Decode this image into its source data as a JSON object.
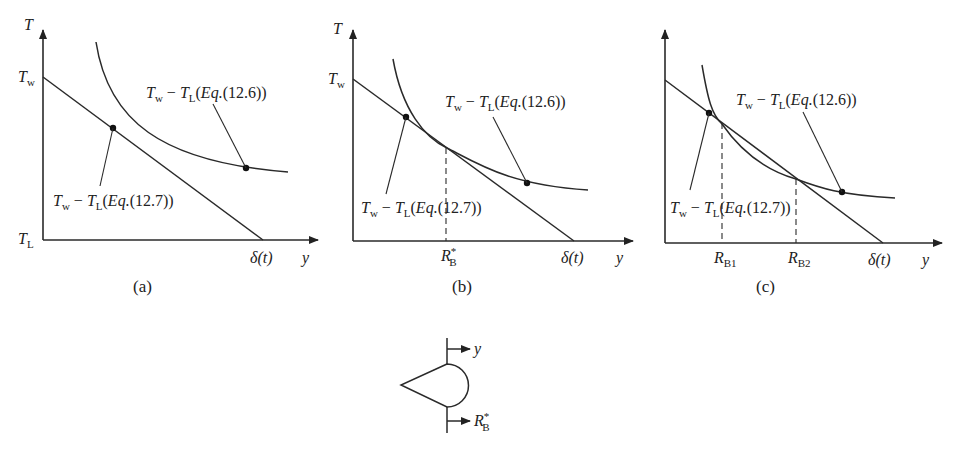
{
  "figure": {
    "panels": [
      {
        "id": "a",
        "caption": "(a)",
        "y_axis_label": "T",
        "x_axis_label": "y",
        "tw_label": "T",
        "tw_sub": "w",
        "tl_label": "T",
        "tl_sub": "L",
        "delta_label": "δ(t)",
        "curve_label": {
          "T1": "T",
          "s1": "w",
          "mid": " − ",
          "T2": "T",
          "s2": "L",
          "eq": "(",
          "eqi": "Eq.",
          "eqn": "(12.6))"
        },
        "line_label": {
          "T1": "T",
          "s1": "w",
          "mid": " − ",
          "T2": "T",
          "s2": "L",
          "eq": "(",
          "eqi": "Eq.",
          "eqn": "(12.7))"
        }
      },
      {
        "id": "b",
        "caption": "(b)",
        "y_axis_label": "T",
        "x_axis_label": "y",
        "tw_label": "T",
        "tw_sub": "w",
        "delta_label": "δ(t)",
        "rb_label": "R",
        "rb_sub": "B",
        "rb_sup": "*",
        "curve_label": {
          "T1": "T",
          "s1": "w",
          "mid": " − ",
          "T2": "T",
          "s2": "L",
          "eq": "(",
          "eqi": "Eq.",
          "eqn": "(12.6))"
        },
        "line_label": {
          "T1": "T",
          "s1": "w",
          "mid": " − ",
          "T2": "T",
          "s2": "L",
          "eq": "(",
          "eqi": "Eq.",
          "eqn": "(12.7))"
        }
      },
      {
        "id": "c",
        "caption": "(c)",
        "x_axis_label": "y",
        "delta_label": "δ(t)",
        "rb1_label": "R",
        "rb1_sub": "B1",
        "rb2_label": "R",
        "rb2_sub": "B2",
        "curve_label": {
          "T1": "T",
          "s1": "w",
          "mid": " − ",
          "T2": "T",
          "s2": "L",
          "eq": "(",
          "eqi": "Eq.",
          "eqn": "(12.6))"
        },
        "line_label": {
          "T1": "T",
          "s1": "w",
          "mid": " − ",
          "T2": "T",
          "s2": "L",
          "eq": "(",
          "eqi": "Eq.",
          "eqn": "(12.7))"
        }
      }
    ],
    "bubble": {
      "y_label": "y",
      "rb_label": "R",
      "rb_sub": "B",
      "rb_sup": "*"
    }
  }
}
